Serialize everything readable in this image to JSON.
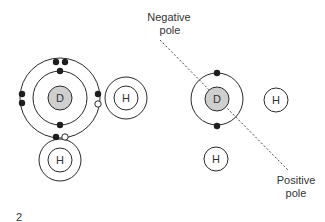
{
  "diagram": {
    "labels": {
      "negative_pole_line1": "Negative",
      "negative_pole_line2": "pole",
      "positive_pole_line1": "Positive",
      "positive_pole_line2": "pole",
      "figure_number": "2"
    },
    "left_molecule": {
      "center_atom": "D",
      "hydrogen_right": "H",
      "hydrogen_bottom": "H"
    },
    "right_molecule": {
      "center_atom": "D",
      "hydrogen_right": "H",
      "hydrogen_bottom": "H"
    },
    "colors": {
      "stroke": "#2a2a2a",
      "nucleus_fill": "#cfcfcf",
      "electron": "#1e1e1e",
      "dashed_line": "#444444",
      "text": "#333333"
    }
  }
}
